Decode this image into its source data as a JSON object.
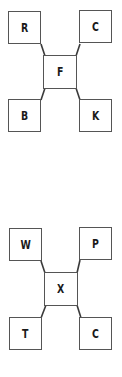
{
  "diagrams": [
    {
      "center": "F",
      "top_left": "R",
      "top_right": "C",
      "bottom_left": "B",
      "bottom_right": "K"
    },
    {
      "center": "X",
      "top_left": "W",
      "top_right": "P",
      "bottom_left": "T",
      "bottom_right": "C"
    }
  ],
  "colors": {
    "line": "#3a3a3a",
    "border": "#555555",
    "text": "#1a1a1a",
    "background": "#ffffff"
  }
}
